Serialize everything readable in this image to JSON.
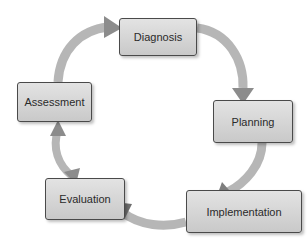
{
  "diagram": {
    "type": "cycle",
    "nodes": [
      {
        "id": "diagnosis",
        "label": "Diagnosis"
      },
      {
        "id": "planning",
        "label": "Planning"
      },
      {
        "id": "implementation",
        "label": "Implementation"
      },
      {
        "id": "evaluation",
        "label": "Evaluation"
      },
      {
        "id": "assessment",
        "label": "Assessment"
      }
    ],
    "edges": [
      {
        "from": "assessment",
        "to": "diagnosis",
        "direction": "forward"
      },
      {
        "from": "diagnosis",
        "to": "planning",
        "direction": "forward"
      },
      {
        "from": "planning",
        "to": "implementation",
        "direction": "forward"
      },
      {
        "from": "implementation",
        "to": "evaluation",
        "direction": "forward"
      },
      {
        "from": "evaluation",
        "to": "assessment",
        "direction": "both"
      }
    ],
    "colors": {
      "arrow": "#8c8c8c",
      "box_fill": "#d6d6d6",
      "box_border": "#4a4a4a",
      "text": "#2a2a2a"
    }
  }
}
